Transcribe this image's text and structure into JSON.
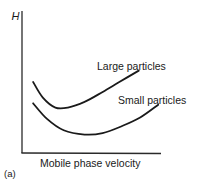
{
  "chart_data": {
    "type": "line",
    "title": "",
    "panel_label": "(a)",
    "xlabel": "Mobile phase velocity",
    "ylabel": "H",
    "xlim": [
      0,
      1
    ],
    "ylim": [
      0,
      1
    ],
    "grid": false,
    "ticks": false,
    "series": [
      {
        "name": "Large particles",
        "label": "Large particles",
        "x": [
          0.08,
          0.15,
          0.24,
          0.33,
          0.45,
          0.58,
          0.7,
          0.84
        ],
        "y": [
          0.5,
          0.39,
          0.32,
          0.32,
          0.36,
          0.43,
          0.5,
          0.58
        ]
      },
      {
        "name": "Small particles",
        "label": "Small particles",
        "x": [
          0.08,
          0.18,
          0.3,
          0.45,
          0.58,
          0.72,
          0.85,
          0.98
        ],
        "y": [
          0.35,
          0.24,
          0.16,
          0.13,
          0.14,
          0.19,
          0.25,
          0.34
        ]
      }
    ]
  }
}
